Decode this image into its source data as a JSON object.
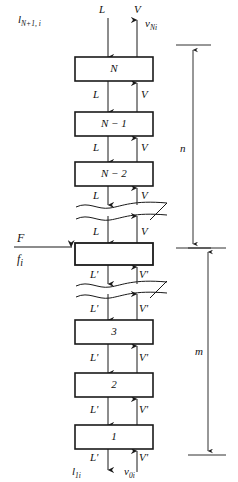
{
  "diagram": {
    "type": "process-flow-stage-cascade",
    "colors": {
      "line": "#1a1a1a",
      "box_fill": "#ffffff",
      "background": "#ffffff"
    },
    "top_streams": {
      "liquid_symbol": "L",
      "liquid_composition": "l",
      "liquid_composition_sub": "N+1, i",
      "vapor_symbol": "V",
      "vapor_composition": "v",
      "vapor_composition_sub": "Ni"
    },
    "bottom_streams": {
      "liquid_symbol": "L'",
      "liquid_composition": "l",
      "liquid_composition_sub": "1i",
      "vapor_symbol": "V'",
      "vapor_composition": "v",
      "vapor_composition_sub": "0i"
    },
    "feed": {
      "symbol": "F",
      "composition": "f",
      "composition_sub": "i"
    },
    "stages": [
      {
        "label": "N",
        "label_sub": "",
        "section": "rectifying"
      },
      {
        "label": "N − 1",
        "label_sub": "",
        "section": "rectifying"
      },
      {
        "label": "N − 2",
        "label_sub": "",
        "section": "rectifying"
      },
      {
        "label": "",
        "label_sub": "",
        "section": "feed"
      },
      {
        "label": "3",
        "label_sub": "",
        "section": "stripping"
      },
      {
        "label": "2",
        "label_sub": "",
        "section": "stripping"
      },
      {
        "label": "1",
        "label_sub": "",
        "section": "stripping"
      }
    ],
    "interstage_labels": {
      "upper_liquid": "L",
      "upper_vapor": "V",
      "lower_liquid": "L'",
      "lower_vapor": "V'"
    },
    "dimensions": [
      {
        "name": "n",
        "label": "n",
        "section": "upper"
      },
      {
        "name": "m",
        "label": "m",
        "section": "lower"
      }
    ]
  }
}
